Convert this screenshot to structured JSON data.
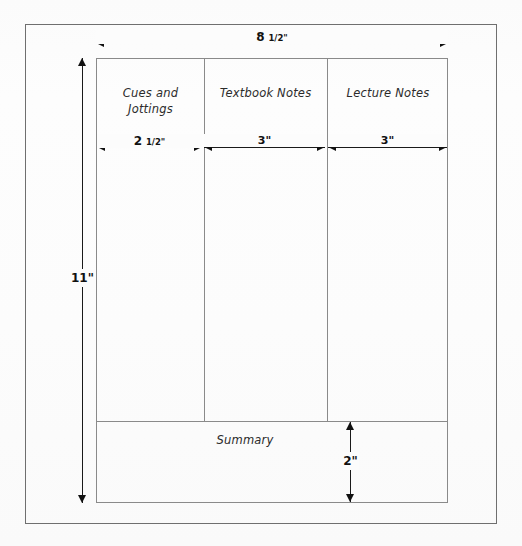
{
  "diagram": {
    "type": "technical-dimension-diagram"
  },
  "sheet": {
    "columns": [
      {
        "id": "cues",
        "label_line_1": "Cues and",
        "label_line_2": "Jottings",
        "width_label": "2 1/2\""
      },
      {
        "id": "textbook",
        "label_line_1": "Textbook Notes",
        "label_line_2": "",
        "width_label": "3\""
      },
      {
        "id": "lecture",
        "label_line_1": "Lecture Notes",
        "label_line_2": "",
        "width_label": "3\""
      }
    ],
    "summary": {
      "label": "Summary",
      "height_label": "2\""
    }
  },
  "dimensions": {
    "page_width": {
      "whole": "8",
      "fraction": "1/2",
      "unit": "\"",
      "full": "8 1/2\""
    },
    "page_height": {
      "full": "11\""
    },
    "col_1_width": {
      "whole": "2",
      "fraction": "1/2",
      "unit": "\"",
      "full": "2 1/2\""
    },
    "col_2_width": {
      "full": "3\""
    },
    "col_3_width": {
      "full": "3\""
    },
    "summary_height": {
      "full": "2\""
    }
  },
  "colors": {
    "ink": "#111111",
    "rule": "#8a8a8a",
    "frame": "#6f6f6f",
    "paper": "#fcfcfc"
  }
}
